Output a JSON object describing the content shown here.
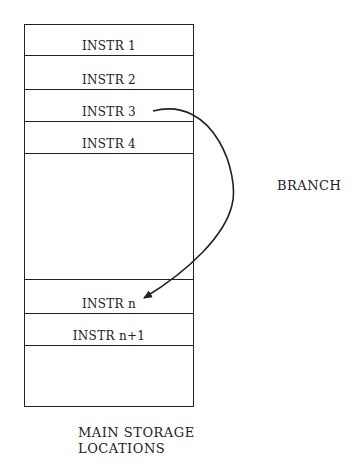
{
  "diagram": {
    "rows": [
      {
        "label": "INSTR 1"
      },
      {
        "label": "INSTR 2"
      },
      {
        "label": "INSTR 3"
      },
      {
        "label": "INSTR 4"
      },
      {
        "label": ""
      },
      {
        "label": "INSTR n"
      },
      {
        "label": "INSTR n+1"
      },
      {
        "label": ""
      }
    ],
    "arrow_label": "BRANCH",
    "caption_line1": "MAIN STORAGE",
    "caption_line2": "LOCATIONS"
  }
}
